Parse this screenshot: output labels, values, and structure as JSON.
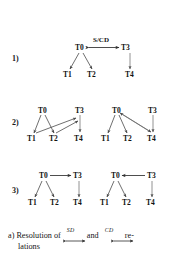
{
  "figure": {
    "caption_prefix": "a) Resolution of ",
    "caption_mid": " and ",
    "caption_suffix": " re-",
    "caption_line2": "lations",
    "rel_sd": "SD",
    "rel_cd": "CD",
    "ink_color": "#151515",
    "arrow_color": "#4a4a4a",
    "background": "#ffffff"
  },
  "rows": [
    {
      "label": "1)",
      "diagrams": [
        {
          "nodes": [
            "T0",
            "T3",
            "T1",
            "T2",
            "T4"
          ],
          "edge_label": "S/CD",
          "edges": [
            {
              "from": "T0",
              "to": "T3",
              "kind": "bidirectional",
              "label": "S/CD"
            },
            {
              "from": "T0",
              "to": "T1",
              "kind": "directed"
            },
            {
              "from": "T0",
              "to": "T2",
              "kind": "directed"
            },
            {
              "from": "T3",
              "to": "T4",
              "kind": "directed"
            }
          ]
        }
      ]
    },
    {
      "label": "2)",
      "diagrams": [
        {
          "nodes": [
            "T0",
            "T3",
            "T1",
            "T2",
            "T4"
          ],
          "edges": [
            {
              "from": "T0",
              "to": "T1",
              "kind": "directed"
            },
            {
              "from": "T0",
              "to": "T2",
              "kind": "directed"
            },
            {
              "from": "T1",
              "to": "T3",
              "kind": "directed"
            },
            {
              "from": "T2",
              "to": "T3",
              "kind": "directed"
            },
            {
              "from": "T3",
              "to": "T4",
              "kind": "directed"
            }
          ]
        },
        {
          "nodes": [
            "T0",
            "T3",
            "T1",
            "T2",
            "T4"
          ],
          "edges": [
            {
              "from": "T0",
              "to": "T1",
              "kind": "directed"
            },
            {
              "from": "T0",
              "to": "T2",
              "kind": "directed"
            },
            {
              "from": "T0",
              "to": "T4",
              "kind": "directed"
            },
            {
              "from": "T4",
              "to": "T0",
              "kind": "directed"
            },
            {
              "from": "T3",
              "to": "T4",
              "kind": "directed"
            }
          ]
        }
      ]
    },
    {
      "label": "3)",
      "diagrams": [
        {
          "nodes": [
            "T0",
            "T3",
            "T1",
            "T2",
            "T4"
          ],
          "edges": [
            {
              "from": "T0",
              "to": "T3",
              "kind": "directed"
            },
            {
              "from": "T0",
              "to": "T1",
              "kind": "directed"
            },
            {
              "from": "T0",
              "to": "T2",
              "kind": "directed"
            },
            {
              "from": "T3",
              "to": "T4",
              "kind": "directed"
            }
          ]
        },
        {
          "nodes": [
            "T0",
            "T3",
            "T1",
            "T2",
            "T4"
          ],
          "edges": [
            {
              "from": "T3",
              "to": "T0",
              "kind": "directed"
            },
            {
              "from": "T0",
              "to": "T1",
              "kind": "directed"
            },
            {
              "from": "T0",
              "to": "T2",
              "kind": "directed"
            },
            {
              "from": "T3",
              "to": "T4",
              "kind": "directed"
            }
          ]
        }
      ]
    }
  ]
}
